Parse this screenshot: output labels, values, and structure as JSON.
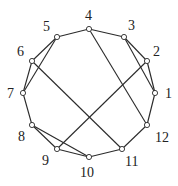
{
  "diagram": {
    "type": "graph",
    "nodes": [
      {
        "id": "1",
        "x": 155,
        "y": 93,
        "lx": 165,
        "ly": 98
      },
      {
        "id": "2",
        "x": 147,
        "y": 61,
        "lx": 153,
        "ly": 56
      },
      {
        "id": "3",
        "x": 124,
        "y": 37,
        "lx": 128,
        "ly": 30
      },
      {
        "id": "4",
        "x": 89,
        "y": 29,
        "lx": 85,
        "ly": 20
      },
      {
        "id": "5",
        "x": 57,
        "y": 37,
        "lx": 43,
        "ly": 31
      },
      {
        "id": "6",
        "x": 32,
        "y": 61,
        "lx": 17,
        "ly": 56
      },
      {
        "id": "7",
        "x": 23,
        "y": 93,
        "lx": 7,
        "ly": 98
      },
      {
        "id": "8",
        "x": 32,
        "y": 125,
        "lx": 18,
        "ly": 141
      },
      {
        "id": "9",
        "x": 57,
        "y": 149,
        "lx": 42,
        "ly": 165
      },
      {
        "id": "10",
        "x": 89,
        "y": 157,
        "lx": 80,
        "ly": 177
      },
      {
        "id": "11",
        "x": 122,
        "y": 149,
        "lx": 125,
        "ly": 166
      },
      {
        "id": "12",
        "x": 147,
        "y": 125,
        "lx": 155,
        "ly": 142
      }
    ],
    "edges": [
      [
        "1",
        "2"
      ],
      [
        "1",
        "3"
      ],
      [
        "2",
        "3"
      ],
      [
        "3",
        "4"
      ],
      [
        "4",
        "5"
      ],
      [
        "5",
        "6"
      ],
      [
        "5",
        "7"
      ],
      [
        "6",
        "7"
      ],
      [
        "7",
        "8"
      ],
      [
        "8",
        "9"
      ],
      [
        "8",
        "10"
      ],
      [
        "9",
        "10"
      ],
      [
        "10",
        "11"
      ],
      [
        "11",
        "12"
      ],
      [
        "12",
        "1"
      ],
      [
        "2",
        "9"
      ],
      [
        "4",
        "12"
      ],
      [
        "6",
        "11"
      ]
    ],
    "colors": {
      "edge": "#2a2a2a",
      "node_fill": "#ffffff",
      "node_stroke": "#2a2a2a",
      "label": "#222222"
    }
  }
}
